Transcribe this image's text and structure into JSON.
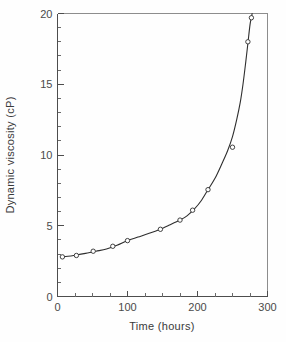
{
  "chart_data": {
    "type": "line",
    "title": "",
    "subtitle": "",
    "xlabel": "Time (hours)",
    "ylabel": "Dynamic viscosity (cP)",
    "xlim": [
      0,
      300
    ],
    "ylim": [
      0,
      20
    ],
    "x_major_ticks": [
      0,
      100,
      200,
      300
    ],
    "x_major_tick_labels": [
      "0",
      "100",
      "200",
      "300"
    ],
    "x_minor_tick_interval": 25,
    "y_major_ticks": [
      0,
      5,
      10,
      15,
      20
    ],
    "y_major_tick_labels": [
      "0",
      "5",
      "10",
      "15",
      "20"
    ],
    "y_minor_tick_interval": 1,
    "grid": false,
    "legend": false,
    "legend_position": "none",
    "marker": "open-circle",
    "series": [
      {
        "name": "Dynamic viscosity",
        "x": [
          7,
          27,
          51,
          79,
          100,
          147,
          175,
          193,
          215,
          250,
          272,
          277
        ],
        "values": [
          2.8,
          2.9,
          3.2,
          3.55,
          3.95,
          4.75,
          5.4,
          6.1,
          7.55,
          10.55,
          18.0,
          19.7
        ]
      }
    ],
    "curve_x": [
      5,
      15,
      25,
      40,
      55,
      70,
      85,
      100,
      115,
      130,
      145,
      160,
      175,
      185,
      195,
      205,
      215,
      225,
      235,
      243,
      250,
      256,
      261,
      265,
      269,
      272,
      275,
      277,
      278
    ],
    "curve_values": [
      2.78,
      2.84,
      2.92,
      3.05,
      3.2,
      3.36,
      3.62,
      3.95,
      4.2,
      4.45,
      4.72,
      5.05,
      5.4,
      5.7,
      6.15,
      6.75,
      7.55,
      8.35,
      9.4,
      10.3,
      11.3,
      12.5,
      13.7,
      15.0,
      16.6,
      17.9,
      19.2,
      19.7,
      20.0
    ]
  },
  "axes": {
    "x_title": "Time (hours)",
    "y_title": "Dynamic viscosity (cP)"
  },
  "colors": {
    "curve": "#2e2e2e",
    "marker_fill": "#ffffff",
    "axis": "#4d4d4d",
    "frame": "#8d8d8d",
    "background": "#fefefe",
    "text": "#3a3a3a"
  }
}
